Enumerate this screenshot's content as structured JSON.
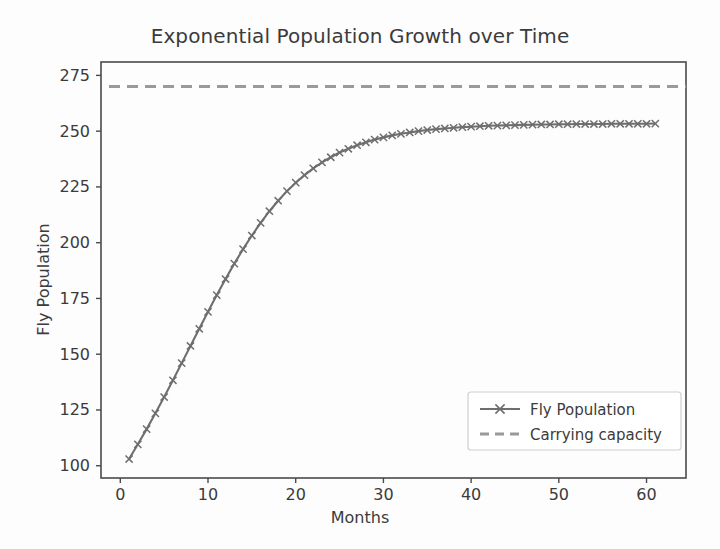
{
  "chart_data": {
    "type": "line",
    "title": "Exponential Population Growth over Time",
    "xlabel": "Months",
    "ylabel": "Fly Population",
    "xlim": [
      -2.2,
      64.5
    ],
    "ylim": [
      94.5,
      281.0
    ],
    "xticks": [
      0,
      10,
      20,
      30,
      40,
      50,
      60
    ],
    "yticks": [
      100,
      125,
      150,
      175,
      200,
      225,
      250,
      275
    ],
    "xticklabels": [
      "0",
      "10",
      "20",
      "30",
      "40",
      "50",
      "60"
    ],
    "yticklabels": [
      "100",
      "125",
      "150",
      "175",
      "200",
      "225",
      "250",
      "275"
    ],
    "grid": false,
    "legend_position": "lower right",
    "series": [
      {
        "name": "Fly Population",
        "style": "solid",
        "marker": "x",
        "color": "#6e6e6e",
        "x": [
          1,
          2,
          3,
          4,
          5,
          6,
          7,
          8,
          9,
          10,
          11,
          12,
          13,
          14,
          15,
          16,
          17,
          18,
          19,
          20,
          21,
          22,
          23,
          24,
          25,
          26,
          27,
          28,
          29,
          30,
          31,
          32,
          33,
          34,
          35,
          36,
          37,
          38,
          39,
          40,
          41,
          42,
          43,
          44,
          45,
          46,
          47,
          48,
          49,
          50,
          51,
          52,
          53,
          54,
          55,
          56,
          57,
          58,
          59,
          60,
          61
        ],
        "values": [
          103.0,
          109.6,
          116.4,
          123.5,
          130.8,
          138.3,
          146.0,
          153.7,
          161.4,
          169.0,
          176.5,
          183.7,
          190.6,
          197.1,
          203.2,
          208.9,
          214.1,
          218.8,
          223.1,
          226.9,
          230.3,
          233.3,
          236.0,
          238.3,
          240.4,
          242.1,
          243.7,
          245.0,
          246.2,
          247.2,
          248.1,
          248.8,
          249.4,
          250.0,
          250.5,
          250.9,
          251.2,
          251.5,
          251.8,
          252.0,
          252.2,
          252.4,
          252.5,
          252.6,
          252.7,
          252.8,
          252.9,
          253.0,
          253.0,
          253.1,
          253.1,
          253.2,
          253.2,
          253.2,
          253.2,
          253.3,
          253.3,
          253.3,
          253.3,
          253.3,
          253.4
        ]
      },
      {
        "name": "Carrying capacity",
        "style": "dashed",
        "marker": "none",
        "color": "#9a9a9a",
        "value": 270
      }
    ],
    "legend": [
      {
        "label": "Fly Population",
        "style": "solid",
        "marker": "x",
        "color": "#6e6e6e"
      },
      {
        "label": "Carrying capacity",
        "style": "dashed",
        "marker": "none",
        "color": "#9a9a9a"
      }
    ]
  },
  "colors": {
    "background": "#fdfdfd",
    "axis": "#4a4a4a",
    "text": "#3b3b3b",
    "series": "#6e6e6e",
    "capacity": "#9a9a9a"
  }
}
